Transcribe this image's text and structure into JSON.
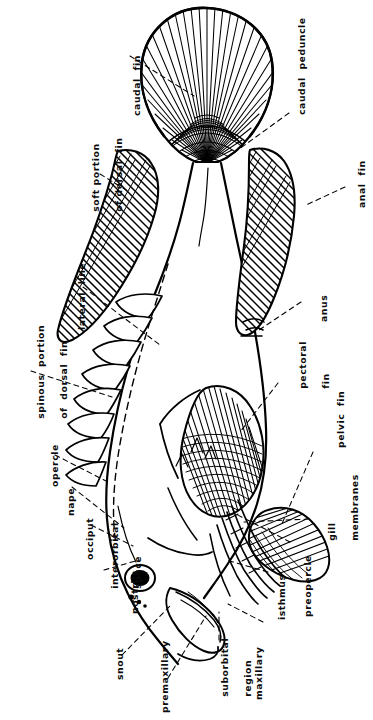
{
  "figure": {
    "kind": "fish-external-anatomy-diagram",
    "orientation": "rotated-90-ccw",
    "background_color": "#ffffff",
    "ink_color": "#000000",
    "leader_line_style": "dashed"
  },
  "labels": [
    {
      "id": "caudal-fin",
      "text": "caudal  fin"
    },
    {
      "id": "caudal-peduncle",
      "text": "caudal  peduncle"
    },
    {
      "id": "soft-portion-dorsal-fin",
      "line1": "soft portion",
      "line2": "of dorsal  fin"
    },
    {
      "id": "anal-fin",
      "text": "anal  fin"
    },
    {
      "id": "lateral-line",
      "text": "lateral  line"
    },
    {
      "id": "anus",
      "text": "anus"
    },
    {
      "id": "spinous-portion-dorsal-fin",
      "line1": "spinous  portion",
      "line2": "of  dorsal  fin"
    },
    {
      "id": "pectoral-fin",
      "line1": "pectoral",
      "line2": "fin"
    },
    {
      "id": "opercle",
      "text": "opercle"
    },
    {
      "id": "pelvic-fin",
      "text": "pelvic  fin"
    },
    {
      "id": "nape",
      "text": "nape"
    },
    {
      "id": "gill-membranes",
      "line1": "gill",
      "line2": "membranes"
    },
    {
      "id": "occiput",
      "text": "occiput"
    },
    {
      "id": "interorbital-space",
      "line1": "interorbital",
      "line2": "space"
    },
    {
      "id": "nostrils",
      "text": "nostrils"
    },
    {
      "id": "isthmus",
      "text": "isthmus"
    },
    {
      "id": "preopercle",
      "text": "preopercle"
    },
    {
      "id": "snout",
      "text": "snout"
    },
    {
      "id": "premaxillary",
      "text": "premaxillary"
    },
    {
      "id": "suborbital-region",
      "line1": "suborbital",
      "line2": "region"
    },
    {
      "id": "maxillary",
      "text": "maxillary"
    }
  ]
}
